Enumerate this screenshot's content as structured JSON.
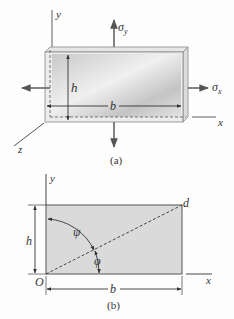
{
  "figure_a": {
    "caption": "(a)",
    "labels": {
      "y_axis": "y",
      "x_axis": "x",
      "z_axis": "z",
      "sigma_y": "σ",
      "sigma_y_sub": "y",
      "sigma_x": "σ",
      "sigma_x_sub": "x",
      "height": "h",
      "width": "b"
    },
    "colors": {
      "plate_light": "#f2f2f2",
      "plate_dark": "#bdbdbd",
      "edge": "#777777",
      "arrow": "#666666"
    }
  },
  "figure_b": {
    "caption": "(b)",
    "labels": {
      "y_axis": "y",
      "x_axis": "x",
      "origin": "O",
      "corner": "d",
      "angle_psi": "ψ",
      "angle_phi": "φ",
      "height": "h",
      "width": "b"
    },
    "colors": {
      "fill": "#dadada",
      "edge": "#555555"
    }
  }
}
